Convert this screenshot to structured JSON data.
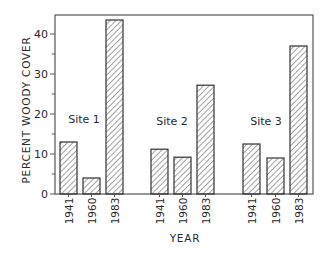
{
  "chart_data": {
    "type": "bar",
    "title": "",
    "xlabel": "YEAR",
    "ylabel": "PERCENT WOODY COVER",
    "ylim": [
      0,
      45
    ],
    "yticks": [
      0,
      10,
      20,
      30,
      40
    ],
    "grid": false,
    "legend": null,
    "groups": [
      {
        "name": "Site 1",
        "categories": [
          "1941",
          "1960",
          "1983"
        ],
        "values": [
          13,
          4,
          43.5
        ]
      },
      {
        "name": "Site 2",
        "categories": [
          "1941",
          "1960",
          "1983"
        ],
        "values": [
          11.2,
          9.2,
          27.2
        ]
      },
      {
        "name": "Site 3",
        "categories": [
          "1941",
          "1960",
          "1983"
        ],
        "values": [
          12.5,
          9,
          37
        ]
      }
    ],
    "fill": "diagonal-hatch",
    "colors": {
      "stroke": "#333333",
      "hatch": "#555555",
      "background": "#ffffff"
    }
  },
  "axes": {
    "xlabel": "YEAR",
    "ylabel": "PERCENT WOODY COVER",
    "ytick_labels": [
      "0",
      "10",
      "20",
      "30",
      "40"
    ]
  },
  "annotations": [
    "Site 1",
    "Site 2",
    "Site 3"
  ]
}
